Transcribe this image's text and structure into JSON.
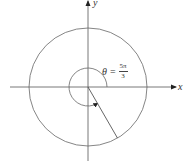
{
  "figure": {
    "x_axis_label": "x",
    "y_axis_label": "y",
    "angle": {
      "variable": "θ",
      "equals": "=",
      "numerator": "5π",
      "denominator": "3",
      "value_degrees": 300
    },
    "colors": {
      "stroke": "#555555",
      "background": "#ffffff"
    }
  }
}
